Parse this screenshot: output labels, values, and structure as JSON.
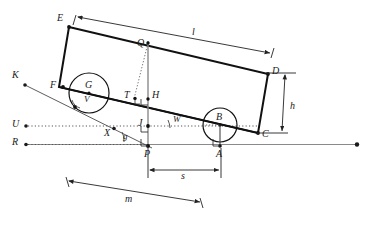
{
  "diagram": {
    "colors": {
      "body_stroke": "#111111",
      "thin_stroke": "#444444",
      "ground_stroke": "#777777",
      "dotted_stroke": "#555555",
      "dimension_stroke": "#222222",
      "label_color": "#1a1a1a",
      "background": "#ffffff"
    },
    "points": [
      {
        "id": "E",
        "label": "E",
        "x": 69,
        "y": 27,
        "lx": 57,
        "ly": 18
      },
      {
        "id": "F",
        "label": "F",
        "x": 63,
        "y": 87,
        "lx": 50,
        "ly": 80
      },
      {
        "id": "D",
        "label": "D",
        "x": 268,
        "y": 74,
        "lx": 272,
        "ly": 68
      },
      {
        "id": "C",
        "label": "C",
        "x": 258,
        "y": 133,
        "lx": 262,
        "ly": 131
      },
      {
        "id": "G",
        "label": "G",
        "x": 89,
        "y": 93,
        "lx": 85,
        "ly": 82
      },
      {
        "id": "B",
        "label": "B",
        "x": 220,
        "y": 125,
        "lx": 216,
        "ly": 114
      },
      {
        "id": "A",
        "label": "A",
        "x": 220,
        "y": 146,
        "lx": 216,
        "ly": 150
      },
      {
        "id": "P",
        "label": "P",
        "x": 148,
        "y": 146,
        "lx": 144,
        "ly": 150
      },
      {
        "id": "J",
        "label": "J",
        "x": 148,
        "y": 126,
        "lx": 138,
        "ly": 120
      },
      {
        "id": "H",
        "label": "H",
        "x": 148,
        "y": 99,
        "lx": 152,
        "ly": 92
      },
      {
        "id": "T",
        "label": "T",
        "x": 135,
        "y": 98,
        "lx": 125,
        "ly": 93
      },
      {
        "id": "Q",
        "label": "Q",
        "x": 148,
        "y": 43,
        "lx": 138,
        "ly": 42
      },
      {
        "id": "K",
        "label": "K",
        "x": 25,
        "y": 85,
        "lx": 12,
        "ly": 74
      },
      {
        "id": "U",
        "label": "U",
        "x": 26,
        "y": 126,
        "lx": 13,
        "ly": 120
      },
      {
        "id": "R",
        "label": "R",
        "x": 26,
        "y": 144,
        "lx": 13,
        "ly": 138
      },
      {
        "id": "X",
        "label": "X",
        "x": 114,
        "y": 128,
        "lx": 106,
        "ly": 131
      },
      {
        "id": "V",
        "label": "V",
        "x": 88,
        "y": 102,
        "lx": 85,
        "ly": 98
      },
      {
        "id": "W",
        "label": "W",
        "x": 178,
        "y": 122,
        "lx": 174,
        "ly": 117
      },
      {
        "id": "g",
        "label": "g",
        "x": 128,
        "y": 140,
        "lx": 124,
        "ly": 135
      }
    ],
    "dimensions": [
      {
        "id": "l",
        "label": "l",
        "lx": 194,
        "ly": 32
      },
      {
        "id": "h",
        "label": "h",
        "lx": 291,
        "ly": 106
      },
      {
        "id": "s",
        "label": "s",
        "lx": 182,
        "ly": 174
      },
      {
        "id": "m",
        "label": "m",
        "lx": 126,
        "ly": 198
      }
    ],
    "angles": [
      {
        "id": "V",
        "label": "V",
        "vertex": "G-contact",
        "desc": "angle at wheel G contact"
      },
      {
        "id": "W",
        "label": "W",
        "vertex": "J",
        "desc": "angle between incline and horizontal at J"
      },
      {
        "id": "g",
        "label": "g",
        "vertex": "X",
        "desc": "slope angle at X"
      }
    ]
  }
}
